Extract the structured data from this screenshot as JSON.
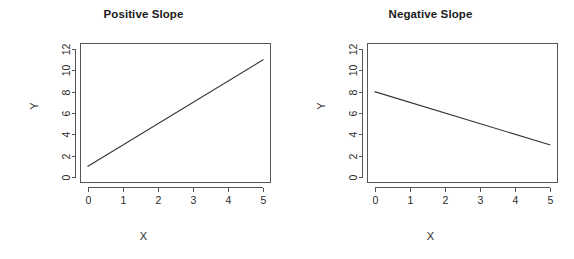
{
  "figure": {
    "width": 574,
    "height": 259,
    "background": "#ffffff",
    "line_color": "#333333",
    "axis_color": "#555555",
    "text_color": "#2b2b2b"
  },
  "panels": [
    {
      "id": "positive-slope",
      "title": "Positive Slope",
      "xlabel": "X",
      "ylabel": "Y"
    },
    {
      "id": "negative-slope",
      "title": "Negative Slope",
      "xlabel": "X",
      "ylabel": "Y"
    }
  ],
  "chart_data": [
    {
      "type": "line",
      "title": "Positive Slope",
      "xlabel": "X",
      "ylabel": "Y",
      "x": [
        0,
        5
      ],
      "y": [
        1,
        11
      ],
      "slope": 2,
      "intercept": 1,
      "xlim": [
        -0.2,
        5.2
      ],
      "ylim": [
        -0.5,
        12.5
      ],
      "xticks": [
        0,
        1,
        2,
        3,
        4,
        5
      ],
      "xtick_labels": [
        "0",
        "1",
        "2",
        "3",
        "4",
        "5"
      ],
      "yticks": [
        0,
        2,
        4,
        6,
        8,
        10,
        12
      ],
      "ytick_labels": [
        "0",
        "2",
        "4",
        "6",
        "8",
        "10",
        "12"
      ],
      "grid": false,
      "legend": false,
      "series": [
        {
          "name": "y = 1 + 2x",
          "values": [
            1,
            11
          ]
        }
      ]
    },
    {
      "type": "line",
      "title": "Negative Slope",
      "xlabel": "X",
      "ylabel": "Y",
      "x": [
        0,
        5
      ],
      "y": [
        8,
        3
      ],
      "slope": -1,
      "intercept": 8,
      "xlim": [
        -0.2,
        5.2
      ],
      "ylim": [
        -0.5,
        12.5
      ],
      "xticks": [
        0,
        1,
        2,
        3,
        4,
        5
      ],
      "xtick_labels": [
        "0",
        "1",
        "2",
        "3",
        "4",
        "5"
      ],
      "yticks": [
        0,
        2,
        4,
        6,
        8,
        10,
        12
      ],
      "ytick_labels": [
        "0",
        "2",
        "4",
        "6",
        "8",
        "10",
        "12"
      ],
      "grid": false,
      "legend": false,
      "series": [
        {
          "name": "y = 8 - x",
          "values": [
            8,
            3
          ]
        }
      ]
    }
  ]
}
